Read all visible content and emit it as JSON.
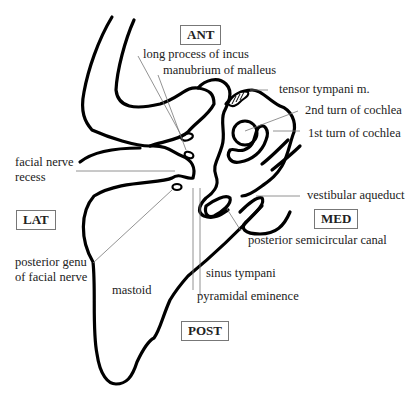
{
  "diagram": {
    "orientation": {
      "ant": "ANT",
      "lat": "LAT",
      "med": "MED",
      "post": "POST"
    },
    "labels": {
      "long_process_incus": "long process of incus",
      "manubrium_malleus": "manubrium of malleus",
      "tensor_tympani": "tensor tympani m.",
      "second_turn_cochlea": "2nd turn of cochlea",
      "first_turn_cochlea": "1st turn of cochlea",
      "facial_nerve_recess_1": "facial nerve",
      "facial_nerve_recess_2": "recess",
      "vestibular_aqueduct": "vestibular aqueduct",
      "posterior_semicircular_canal": "posterior semicircular canal",
      "posterior_genu_1": "posterior genu",
      "posterior_genu_2": "of facial nerve",
      "sinus_tympani": "sinus tympani",
      "pyramidal_eminence": "pyramidal eminence",
      "mastoid": "mastoid"
    },
    "colors": {
      "outline": "#000000",
      "leader": "#777777",
      "text": "#222222"
    }
  }
}
